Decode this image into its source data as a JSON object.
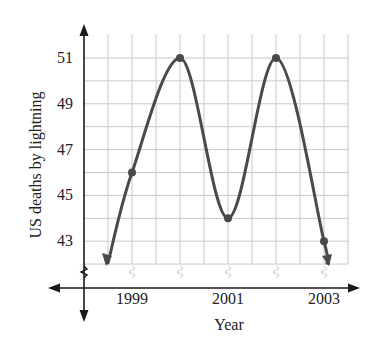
{
  "chart_data": {
    "type": "line",
    "title": "",
    "xlabel": "Year",
    "ylabel": "US deaths by lightning",
    "x": [
      1999,
      2000,
      2001,
      2002,
      2003
    ],
    "values": [
      46,
      51,
      44,
      51,
      43
    ],
    "x_tick_labels": [
      "1999",
      "2001",
      "2003"
    ],
    "y_tick_labels": [
      "43",
      "45",
      "47",
      "49",
      "51"
    ],
    "ylim": [
      42,
      52
    ],
    "xlim": [
      1998,
      2003.5
    ],
    "grid": true,
    "axis_breaks": [
      "x",
      "y"
    ],
    "curve_extends_with_arrows": true,
    "legend": null
  },
  "colors": {
    "curve": "#4a4a4a",
    "grid": "#c9c9c9",
    "axis": "#1a1a1a",
    "background": "#ffffff"
  }
}
